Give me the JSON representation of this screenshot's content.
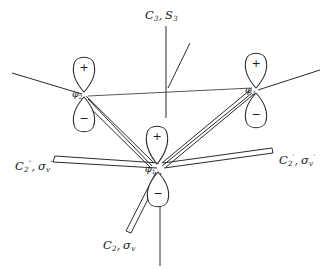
{
  "figure": {
    "kind": "molecular-orbital-symmetry-diagram",
    "line_color": "#2b2b2b",
    "text_color": "#1a1a1a",
    "background": "#ffffff"
  },
  "orbitals": [
    {
      "id": "phi1",
      "label": "φ",
      "subscript": "1",
      "position": "bottom-center",
      "top_lobe_sign": "+",
      "bottom_lobe_sign": "−",
      "cx": 157,
      "cy": 168
    },
    {
      "id": "phi2",
      "label": "φ",
      "subscript": "2",
      "position": "upper-left",
      "top_lobe_sign": "+",
      "bottom_lobe_sign": "−",
      "cx": 84,
      "cy": 93
    },
    {
      "id": "phi3",
      "label": "φ",
      "subscript": "3",
      "position": "upper-right",
      "top_lobe_sign": "+",
      "bottom_lobe_sign": "−",
      "cx": 256,
      "cy": 89
    }
  ],
  "symmetry_labels": [
    {
      "id": "c3-s3",
      "text": "C₃, S₃",
      "parts": [
        {
          "base": "C",
          "sub": "3"
        },
        {
          "base": "S",
          "sub": "3"
        }
      ],
      "position": "top-center",
      "x": 145,
      "y": 10
    },
    {
      "id": "c2pp-sigmavpp",
      "text": "C₂″, σᵥ″",
      "parts": [
        {
          "base": "C",
          "sub": "2",
          "sup": "″"
        },
        {
          "base": "σ",
          "sub": "v",
          "sup": "″"
        }
      ],
      "position": "left",
      "x": 15,
      "y": 161
    },
    {
      "id": "c2p-sigmavp",
      "text": "C₂′, σᵥ′",
      "parts": [
        {
          "base": "C",
          "sub": "2",
          "sup": "′"
        },
        {
          "base": "σ",
          "sub": "v",
          "sup": "′"
        }
      ],
      "position": "right",
      "x": 279,
      "y": 155
    },
    {
      "id": "c2-sigmav",
      "text": "C₂, σᵥ",
      "parts": [
        {
          "base": "C",
          "sub": "2"
        },
        {
          "base": "σ",
          "sub": "v"
        }
      ],
      "position": "bottom",
      "x": 103,
      "y": 240
    }
  ],
  "lobe_signs": {
    "plus": "+",
    "minus": "−"
  }
}
